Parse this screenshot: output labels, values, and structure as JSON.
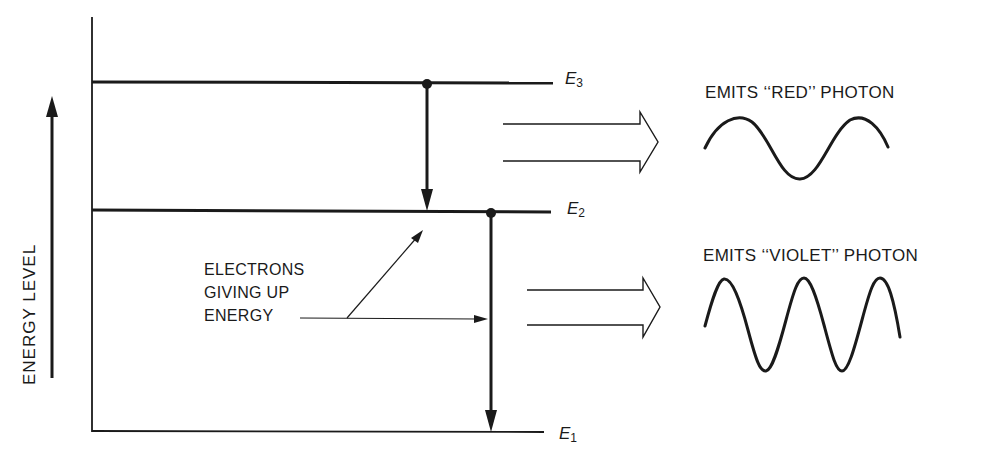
{
  "diagram": {
    "axis_label": "ENERGY LEVEL",
    "levels": [
      {
        "id": "E3",
        "symbol": "E",
        "subscript": "3"
      },
      {
        "id": "E2",
        "symbol": "E",
        "subscript": "2"
      },
      {
        "id": "E1",
        "symbol": "E",
        "subscript": "1"
      }
    ],
    "callout": {
      "line1": "ELECTRONS",
      "line2": "GIVING UP",
      "line3": "ENERGY"
    },
    "transitions": [
      {
        "from": "E3",
        "to": "E2",
        "photon": "red"
      },
      {
        "from": "E2",
        "to": "E1",
        "photon": "violet"
      }
    ],
    "photons": [
      {
        "label": "EMITS ‘‘RED’’ PHOTON",
        "wave_cycles": 1.5
      },
      {
        "label": "EMITS ‘‘VIOLET’’ PHOTON",
        "wave_cycles": 2.5
      }
    ],
    "colors": {
      "ink": "#1a1a1a",
      "background": "#ffffff"
    }
  }
}
